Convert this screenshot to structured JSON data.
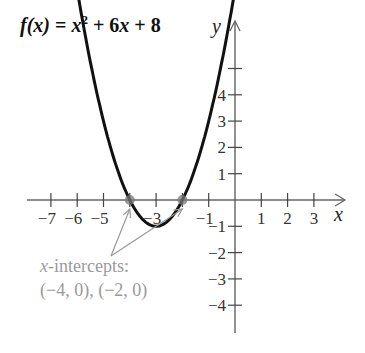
{
  "chart_data": {
    "type": "line",
    "title_parts": {
      "fx": "f(x)",
      "eq": " = ",
      "x": "x",
      "exp": "2",
      "rest": " + 6x + 8"
    },
    "xlabel": "x",
    "ylabel": "y",
    "xlim": [
      -8,
      4
    ],
    "ylim": [
      -5,
      6
    ],
    "x_ticks": [
      -7,
      -6,
      -5,
      -4,
      -3,
      -2,
      -1,
      1,
      2,
      3
    ],
    "x_tick_labels": [
      "−7",
      "−6",
      "−5",
      "",
      "−3",
      "",
      "−1",
      "1",
      "2",
      "3"
    ],
    "y_ticks": [
      -4,
      -3,
      -2,
      -1,
      1,
      2,
      3,
      4,
      5
    ],
    "y_tick_labels": [
      "−4",
      "−3",
      "−2",
      "−1",
      "1",
      "2",
      "3",
      "4",
      ""
    ],
    "grid": false,
    "series": [
      {
        "name": "f(x) = x^2 + 6x + 8",
        "function": "x^2 + 6x + 8",
        "x": [
          -5.95,
          -5.5,
          -5,
          -4.5,
          -4,
          -3.5,
          -3,
          -2.5,
          -2,
          -1.5,
          -1,
          -0.5,
          -0.05
        ],
        "y": [
          6.1,
          4.25,
          3,
          1.25,
          0,
          -0.75,
          -1,
          -0.75,
          0,
          1.25,
          3,
          5.25,
          6.1
        ],
        "color": "#111111"
      }
    ],
    "points": [
      {
        "x": -4,
        "y": 0,
        "label": "x-intercept"
      },
      {
        "x": -2,
        "y": 0,
        "label": "x-intercept"
      }
    ],
    "vertex": {
      "x": -3,
      "y": -1
    },
    "annotations": [
      {
        "text_italic": "x",
        "text": "-intercepts:",
        "line2": "(−4, 0), (−2, 0)",
        "color": "#9a9a9a"
      }
    ]
  }
}
